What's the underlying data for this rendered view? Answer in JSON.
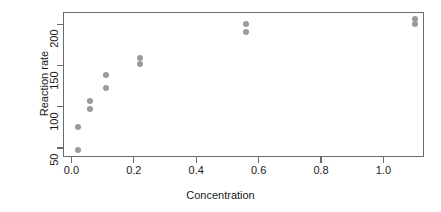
{
  "chart_data": {
    "type": "scatter",
    "title": "",
    "xlabel": "Concentration",
    "ylabel": "Reaction rate",
    "xlim": [
      -0.027,
      1.13
    ],
    "ylim": [
      39,
      215
    ],
    "xticks": [
      0.0,
      0.2,
      0.4,
      0.6,
      0.8,
      1.0
    ],
    "xticklabels": [
      "0.0",
      "0.2",
      "0.4",
      "0.6",
      "0.8",
      "1.0"
    ],
    "yticks": [
      50,
      100,
      150,
      200
    ],
    "yticklabels": [
      "50",
      "100",
      "150",
      "200"
    ],
    "grid": false,
    "legend": false,
    "point_color": "#9a9a9a",
    "point_shape": "filled-circle",
    "axis_color": "#6b6b6b",
    "text_color": "#1a1a1a",
    "background": "#ffffff",
    "series": [
      {
        "name": "Puromycin treated",
        "points": [
          {
            "x": 0.02,
            "y": 47
          },
          {
            "x": 0.02,
            "y": 76
          },
          {
            "x": 0.06,
            "y": 97
          },
          {
            "x": 0.06,
            "y": 107
          },
          {
            "x": 0.11,
            "y": 123
          },
          {
            "x": 0.11,
            "y": 139
          },
          {
            "x": 0.22,
            "y": 152
          },
          {
            "x": 0.22,
            "y": 159
          },
          {
            "x": 0.56,
            "y": 191
          },
          {
            "x": 0.56,
            "y": 201
          },
          {
            "x": 1.1,
            "y": 200
          },
          {
            "x": 1.1,
            "y": 207
          }
        ]
      }
    ]
  }
}
